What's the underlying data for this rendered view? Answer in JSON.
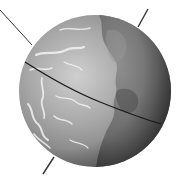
{
  "illustration": {
    "subject": "globe",
    "description": "Grayscale globe with a tilted rotation axis and an equator line",
    "colors": {
      "background": "#ffffff",
      "ocean_light": "#c9c9c9",
      "ocean_mid": "#9a9a9a",
      "ocean_dark": "#5e5e5e",
      "land_light": "#8a8a8a",
      "land_dark": "#4a4a4a",
      "cloud": "#eeeeee",
      "axis_line": "#333333",
      "equator_line": "#1a1a1a"
    },
    "parts": [
      "globe-sphere",
      "landmass",
      "cloud-swirls",
      "rotation-axis",
      "equator-line",
      "terminator-shadow"
    ]
  }
}
